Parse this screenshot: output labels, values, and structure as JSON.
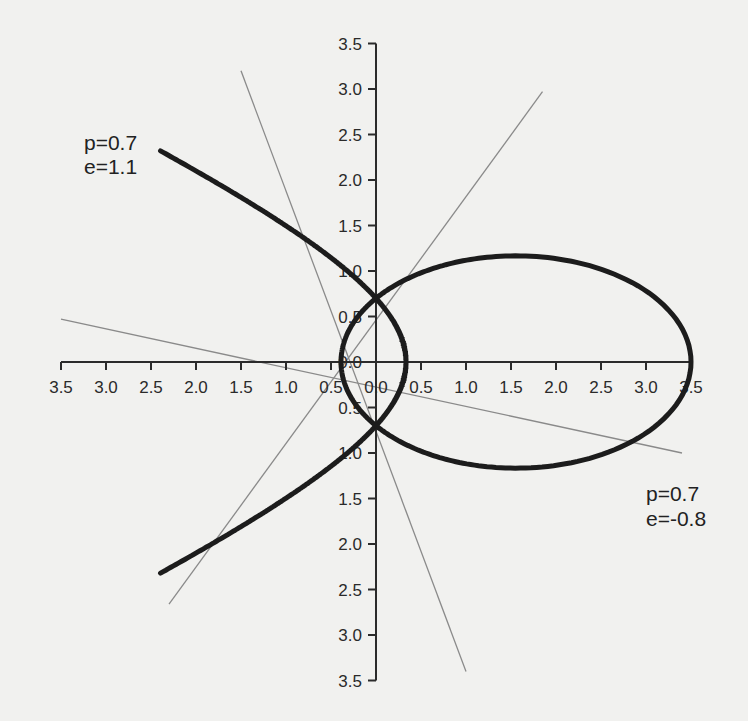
{
  "chart_data": {
    "type": "line",
    "title": "",
    "xlabel": "",
    "ylabel": "",
    "xlim": [
      -3.5,
      3.5
    ],
    "ylim": [
      -3.5,
      3.5
    ],
    "grid": false,
    "x_tick_labels": [
      "3.5",
      "3.0",
      "2.5",
      "2.0",
      "1.5",
      "1.0",
      "0.5",
      "0.0",
      "0.5",
      "1.0",
      "1.5",
      "2.0",
      "2.5",
      "3.0",
      "3.5"
    ],
    "x_ticks": [
      -3.5,
      -3.0,
      -2.5,
      -2.0,
      -1.5,
      -1.0,
      -0.5,
      0.0,
      0.5,
      1.0,
      1.5,
      2.0,
      2.5,
      3.0,
      3.5
    ],
    "y_tick_labels": [
      "3.5",
      "3.0",
      "2.5",
      "2.0",
      "1.5",
      "1.0",
      "0.5",
      "0.0",
      "0.5",
      "1.0",
      "1.5",
      "2.0",
      "2.5",
      "3.0",
      "3.5"
    ],
    "y_ticks": [
      3.5,
      3.0,
      2.5,
      2.0,
      1.5,
      1.0,
      0.5,
      0.0,
      -0.5,
      -1.0,
      -1.5,
      -2.0,
      -2.5,
      -3.0,
      -3.5
    ],
    "series": [
      {
        "name": "hyperbola",
        "equation": "r = p / (1 + e cos θ)",
        "p": 0.7,
        "e": 1.1,
        "label_lines": [
          "p=0.7",
          "e=1.1"
        ],
        "points": [
          [
            -2.4,
            2.3
          ],
          [
            -1.5,
            1.66
          ],
          [
            -0.8,
            1.15
          ],
          [
            0.0,
            0.7
          ],
          [
            0.2,
            0.45
          ],
          [
            0.333,
            0.0
          ],
          [
            0.2,
            -0.45
          ],
          [
            0.0,
            -0.7
          ],
          [
            -0.8,
            -1.15
          ],
          [
            -1.5,
            -1.66
          ],
          [
            -2.4,
            -2.3
          ]
        ]
      },
      {
        "name": "ellipse",
        "equation": "r = p / (1 + e cos θ)",
        "p": 0.7,
        "e": -0.8,
        "label_lines": [
          "p=0.7",
          "e=-0.8"
        ],
        "points": [
          [
            3.5,
            0.0
          ],
          [
            3.0,
            0.86
          ],
          [
            1.56,
            1.17
          ],
          [
            0.0,
            0.7
          ],
          [
            -0.389,
            0.0
          ],
          [
            0.0,
            -0.7
          ],
          [
            1.56,
            -1.17
          ],
          [
            3.0,
            -0.86
          ],
          [
            3.5,
            0.0
          ]
        ]
      }
    ],
    "reference_lines": [
      {
        "from": [
          -3.5,
          0.47
        ],
        "to": [
          3.4,
          -1.0
        ]
      },
      {
        "from": [
          -1.5,
          3.2
        ],
        "to": [
          1.0,
          -3.4
        ]
      },
      {
        "from": [
          1.85,
          2.97
        ],
        "to": [
          -2.3,
          -2.66
        ]
      }
    ],
    "annotations": [
      {
        "text": "p=0.7",
        "line": 1,
        "near": [
          -3.4,
          2.6
        ]
      },
      {
        "text": "e=1.1",
        "line": 2,
        "near": [
          -3.4,
          2.3
        ]
      },
      {
        "text": "p=0.7",
        "line": 1,
        "near": [
          2.7,
          -1.45
        ]
      },
      {
        "text": "e=-0.8",
        "line": 2,
        "near": [
          2.7,
          -1.75
        ]
      }
    ]
  },
  "labels": {
    "hyperbola_p": "p=0.7",
    "hyperbola_e": "e=1.1",
    "ellipse_p": "p=0.7",
    "ellipse_e": "e=-0.8"
  }
}
